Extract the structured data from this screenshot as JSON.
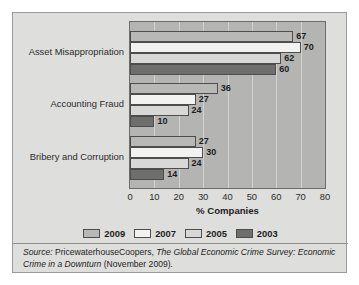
{
  "chart_data": {
    "type": "bar",
    "orientation": "horizontal",
    "title": "",
    "subtitle": "",
    "xlabel": "% Companies",
    "ylabel": "",
    "xlim": [
      0,
      80
    ],
    "xticks": [
      0,
      10,
      20,
      30,
      40,
      50,
      60,
      70,
      80
    ],
    "grid": true,
    "legend_position": "bottom",
    "categories": [
      "Asset Misappropriation",
      "Accounting Fraud",
      "Bribery and Corruption"
    ],
    "series": [
      {
        "name": "2009",
        "color": "#b8b8b6",
        "values": [
          67,
          36,
          27
        ]
      },
      {
        "name": "2007",
        "color": "#f2f2f0",
        "values": [
          70,
          27,
          30
        ]
      },
      {
        "name": "2005",
        "color": "#d8d8d6",
        "values": [
          62,
          24,
          24
        ]
      },
      {
        "name": "2003",
        "color": "#6e6e6c",
        "values": [
          60,
          10,
          14
        ]
      }
    ],
    "annotations": {
      "source_prefix": "Source:",
      "source_publisher": "PricewaterhouseCoopers,",
      "source_title": "The Global Economic Crime Survey: Economic Crime in a Downturn",
      "source_date": "(November 2009)."
    }
  },
  "figure": {
    "background_color": "#dededc",
    "plot_background_color": "#b4b4b2",
    "border_color": "#9a9a98"
  }
}
